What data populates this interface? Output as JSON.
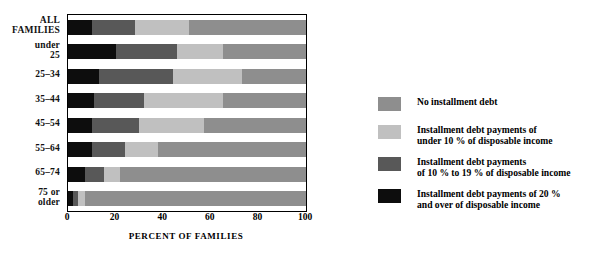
{
  "chart_data": {
    "type": "bar",
    "orientation": "horizontal",
    "stacked": true,
    "title": "",
    "xlabel": "PERCENT OF FAMILIES",
    "ylabel": "",
    "xlim": [
      0,
      100
    ],
    "xticks": [
      "0",
      "20",
      "40",
      "60",
      "80",
      "100"
    ],
    "xtick_values": [
      0,
      20,
      40,
      60,
      80,
      100
    ],
    "grid": false,
    "legend_position": "right",
    "categories": [
      "ALL FAMILIES",
      "under 25",
      "25–34",
      "35–44",
      "45–54",
      "55–64",
      "65–74",
      "75 or older"
    ],
    "series": [
      {
        "name": "Installment debt payments of 20% and over of disposable income",
        "color": "#0d0d0d",
        "values": [
          10,
          20,
          13,
          11,
          10,
          10,
          7,
          2
        ]
      },
      {
        "name": "Installment debt payments of 10% to 19% of disposable income",
        "color": "#585858",
        "values": [
          18,
          26,
          31,
          21,
          20,
          14,
          8,
          2
        ]
      },
      {
        "name": "Installment debt payments of under 10% of disposable income",
        "color": "#c0c0c0",
        "values": [
          23,
          19,
          29,
          33,
          27,
          14,
          7,
          3
        ]
      },
      {
        "name": "No installment debt",
        "color": "#8e8e8e",
        "values": [
          49,
          35,
          27,
          35,
          43,
          62,
          78,
          93
        ]
      }
    ]
  },
  "axis": {
    "y_labels": [
      {
        "line1": "ALL",
        "line2": "FAMILIES"
      },
      {
        "line1": "under",
        "line2": "25"
      },
      {
        "line1": "25–34",
        "line2": ""
      },
      {
        "line1": "35–44",
        "line2": ""
      },
      {
        "line1": "45–54",
        "line2": ""
      },
      {
        "line1": "55–64",
        "line2": ""
      },
      {
        "line1": "65–74",
        "line2": ""
      },
      {
        "line1": "75 or",
        "line2": "older"
      }
    ],
    "x_title": "PERCENT OF FAMILIES",
    "x_ticks": [
      "0",
      "20",
      "40",
      "60",
      "80",
      "100"
    ]
  },
  "legend": {
    "items": [
      {
        "color": "#8e8e8e",
        "line1": "No installment debt",
        "line2": ""
      },
      {
        "color": "#c0c0c0",
        "line1": "Installment debt payments of",
        "line2": "under 10 % of disposable income"
      },
      {
        "color": "#585858",
        "line1": "Installment debt payments",
        "line2": "of 10 % to 19 % of disposable income"
      },
      {
        "color": "#0d0d0d",
        "line1": "Installment debt payments of 20 %",
        "line2": "and over of disposable income"
      }
    ]
  },
  "colors": {
    "no_debt": "#8e8e8e",
    "under_10": "#c0c0c0",
    "ten_to_19": "#585858",
    "twenty_plus": "#0d0d0d",
    "frame": "#000000",
    "background": "#ffffff"
  }
}
